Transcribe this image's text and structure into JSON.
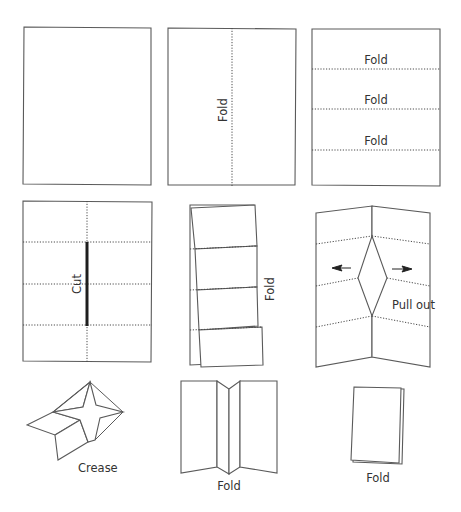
{
  "diagram": {
    "steps": [
      {
        "id": "step-1",
        "description": "Blank sheet"
      },
      {
        "id": "step-2",
        "labels": [
          "Fold"
        ]
      },
      {
        "id": "step-3",
        "labels": [
          "Fold",
          "Fold",
          "Fold"
        ]
      },
      {
        "id": "step-4",
        "labels": [
          "Cut"
        ]
      },
      {
        "id": "step-5",
        "labels": [
          "Fold"
        ]
      },
      {
        "id": "step-6",
        "labels": [
          "Pull out"
        ]
      },
      {
        "id": "step-7",
        "labels": [
          "Crease"
        ]
      },
      {
        "id": "step-8",
        "labels": [
          "Fold"
        ]
      },
      {
        "id": "step-9",
        "labels": [
          "Fold"
        ]
      }
    ],
    "colors": {
      "outline": "#5a5a5a",
      "cut_line": "#1e1e1e",
      "text": "#333333",
      "background": "#ffffff"
    }
  }
}
